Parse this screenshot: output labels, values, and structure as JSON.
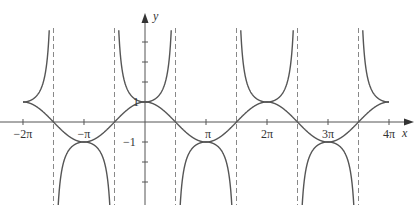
{
  "chart_data": {
    "type": "line",
    "title": "",
    "xlabel": "x",
    "ylabel": "y",
    "xlim": [
      -6.2832,
      12.5664
    ],
    "ylim": [
      -4.2,
      4.7
    ],
    "grid": false,
    "legend": null,
    "x_ticks": [
      {
        "value": -6.2832,
        "label": "−2π"
      },
      {
        "value": -3.1416,
        "label": "−π"
      },
      {
        "value": 3.1416,
        "label": "π"
      },
      {
        "value": 6.2832,
        "label": "2π"
      },
      {
        "value": 9.4248,
        "label": "3π"
      },
      {
        "value": 12.5664,
        "label": "4π"
      }
    ],
    "y_ticks": [
      {
        "value": 4,
        "label": ""
      },
      {
        "value": 3,
        "label": ""
      },
      {
        "value": 2,
        "label": ""
      },
      {
        "value": 1,
        "label": "1"
      },
      {
        "value": -1,
        "label": "−1"
      },
      {
        "value": -2,
        "label": ""
      },
      {
        "value": -3,
        "label": ""
      }
    ],
    "series": [
      {
        "name": "y = cos x",
        "function": "cos",
        "x_range": [
          -6.2832,
          12.5664
        ]
      },
      {
        "name": "y = sec x",
        "function": "sec",
        "x_range": [
          -6.2832,
          12.5664
        ]
      }
    ],
    "asymptotes_x": [
      -4.7124,
      -1.5708,
      1.5708,
      4.7124,
      7.854,
      10.9956
    ],
    "colors": {
      "curve": "#555555",
      "axis": "#555555",
      "asymptote": "#888888"
    }
  },
  "labels": {
    "x_axis": "x",
    "y_axis": "y",
    "y_one": "1",
    "y_minus_one": "−1",
    "xt": [
      "−2π",
      "−π",
      "π",
      "2π",
      "3π",
      "4π"
    ]
  }
}
